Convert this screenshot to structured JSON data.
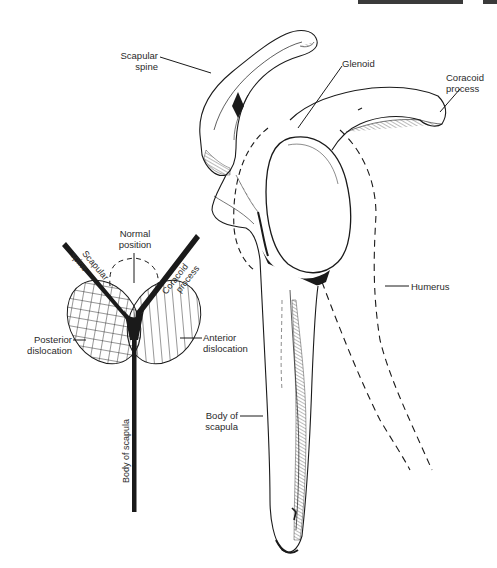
{
  "figure": {
    "type": "anatomical line drawing"
  },
  "main_drawing": {
    "labels": {
      "scapular_spine": [
        "Scapular",
        "spine"
      ],
      "glenoid": "Glenoid",
      "coracoid_process": [
        "Coracoid",
        "process"
      ],
      "humerus": "Humerus",
      "body_of_scapula": [
        "Body of",
        "scapula"
      ]
    }
  },
  "inset_schematic": {
    "labels": {
      "normal_position": [
        "Normal",
        "position"
      ],
      "scapular_spine_arm": [
        "Scapular",
        "spine"
      ],
      "coracoid_process_arm": [
        "Coracoid",
        "process"
      ],
      "posterior_dislocation": [
        "Posterior",
        "dislocation"
      ],
      "anterior_dislocation": [
        "Anterior",
        "dislocation"
      ],
      "body_of_scapula_stem": "Body of scapula"
    },
    "regions": [
      {
        "name": "posterior-dislocation",
        "pattern": "crosshatch"
      },
      {
        "name": "anterior-dislocation",
        "pattern": "diagonal-hatch"
      },
      {
        "name": "normal-position",
        "pattern": "dashed-outline"
      }
    ]
  },
  "colors": {
    "ink": "#1a1a1a",
    "background": "#ffffff",
    "header_bar": "#3a3a3a"
  }
}
